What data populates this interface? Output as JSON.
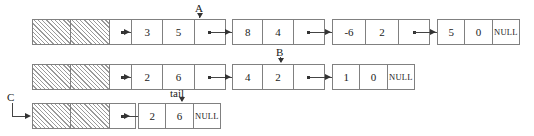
{
  "diagram": {
    "colors": {
      "stroke": "#808080",
      "arrow": "#333333",
      "text": "#1a1a1a",
      "hatch": "#9a9a9a",
      "background": "#ffffff"
    },
    "pointer_glyph": "•",
    "labels": [
      {
        "name": "A",
        "text": "A"
      },
      {
        "name": "B",
        "text": "B"
      },
      {
        "name": "C",
        "text": "C"
      },
      {
        "name": "tail",
        "text": "tail"
      }
    ],
    "rows": [
      {
        "name": "row-1",
        "head_cells": [
          "",
          "",
          "ptr"
        ],
        "nodes": [
          {
            "name": "node-3-5",
            "data1": "3",
            "data2": "5",
            "next": "ptr"
          },
          {
            "name": "node-8-4",
            "data1": "8",
            "data2": "4",
            "next": "ptr"
          },
          {
            "name": "node-neg6-2",
            "data1": "-6",
            "data2": "2",
            "next": "ptr"
          },
          {
            "name": "node-5-0",
            "data1": "5",
            "data2": "0",
            "next": "NULL"
          }
        ]
      },
      {
        "name": "row-2",
        "head_cells": [
          "",
          "",
          "ptr"
        ],
        "nodes": [
          {
            "name": "node-2-6-a",
            "data1": "2",
            "data2": "6",
            "next": "ptr"
          },
          {
            "name": "node-4-2",
            "data1": "4",
            "data2": "2",
            "next": "ptr"
          },
          {
            "name": "node-1-0",
            "data1": "1",
            "data2": "0",
            "next": "NULL"
          }
        ]
      },
      {
        "name": "row-3",
        "head_cells": [
          "",
          "",
          "ptr"
        ],
        "nodes": [
          {
            "name": "node-2-6-b",
            "data1": "2",
            "data2": "6",
            "next": "NULL"
          }
        ]
      }
    ]
  }
}
